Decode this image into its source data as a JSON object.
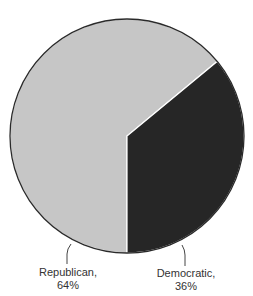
{
  "chart_data": {
    "type": "pie",
    "title": "",
    "categories": [
      "Republican",
      "Democratic"
    ],
    "values": [
      64,
      36
    ],
    "unit": "%",
    "colors": [
      "#c6c6c6",
      "#262626"
    ],
    "labels": [
      {
        "name": "Republican,",
        "value": "64%"
      },
      {
        "name": "Democratic,",
        "value": "36%"
      }
    ],
    "legend": "none"
  }
}
